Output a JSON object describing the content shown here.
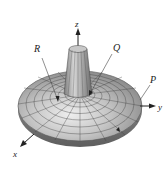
{
  "figure": {
    "type": "3d-surface",
    "axes": {
      "x_label": "x",
      "y_label": "y",
      "z_label": "z"
    },
    "points": [
      {
        "label": "R"
      },
      {
        "label": "Q"
      },
      {
        "label": "P"
      }
    ],
    "colors": {
      "surface_light": "#d8d8d8",
      "surface_mid": "#a8a8a8",
      "surface_dark": "#6e6e6e",
      "mesh": "#3c3c3c",
      "axis": "#222222",
      "background": "#ffffff"
    }
  }
}
